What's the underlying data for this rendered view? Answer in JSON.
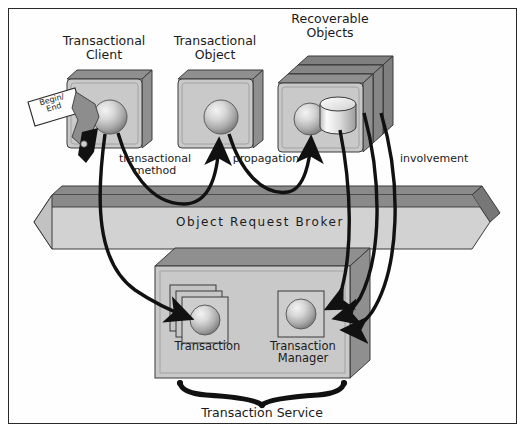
{
  "diagram": {
    "nodes": {
      "transactional_client": {
        "label": "Transactional\nClient",
        "icon": "box-3d-with-sphere"
      },
      "transactional_object": {
        "label": "Transactional\nObject",
        "icon": "box-3d-with-sphere"
      },
      "recoverable_objects": {
        "label": "Recoverable\nObjects",
        "icon": "card-stack-with-sphere-and-cylinder"
      },
      "object_request_broker": {
        "label": "Object Request Broker",
        "icon": "bidirectional-bus-bar"
      },
      "transaction": {
        "label": "Transaction",
        "icon": "card-stack-with-sphere"
      },
      "transaction_manager": {
        "label": "Transaction\nManager",
        "icon": "card-with-sphere"
      },
      "transaction_service": {
        "label": "Transaction Service",
        "icon": "brace-bracket"
      }
    },
    "tags": {
      "begin_end": {
        "line1": "Begin/",
        "line2": "End",
        "icon": "tilted-paper-tag"
      }
    },
    "edges": [
      {
        "label": "transactional\nmethod",
        "from": "transactional_client",
        "to": "transactional_object"
      },
      {
        "label": "propagation",
        "from": "transactional_object",
        "to": "recoverable_objects"
      },
      {
        "label": "involvement",
        "from": "recoverable_objects",
        "to": "transaction_manager"
      }
    ],
    "caption": ""
  },
  "colors": {
    "box_face": "#c9c9c9",
    "box_top": "#8f8f8f",
    "box_side": "#a5a5a5",
    "bar_face": "#d2d2d2",
    "bar_top": "#8a8a8a",
    "outline": "#3a3a3a",
    "arrow": "#111111",
    "frame": "#2a2a2a",
    "text": "#1b1b1b",
    "page": "#ffffff"
  }
}
